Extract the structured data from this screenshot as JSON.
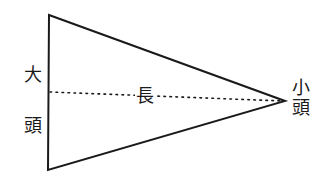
{
  "diagram": {
    "type": "triangle-taper",
    "stroke_color": "#1a1a1a",
    "background": "#ffffff",
    "shape": {
      "base_top": [
        49,
        15
      ],
      "base_bottom": [
        48,
        170
      ],
      "apex": [
        285,
        101
      ]
    },
    "axis": {
      "style": "dotted",
      "from": [
        49,
        92
      ],
      "to": [
        285,
        101
      ]
    },
    "labels": {
      "large_end_top": "大",
      "large_end_bottom": "頭",
      "length": "長",
      "small_end_top": "小",
      "small_end_bottom": "頭"
    }
  }
}
